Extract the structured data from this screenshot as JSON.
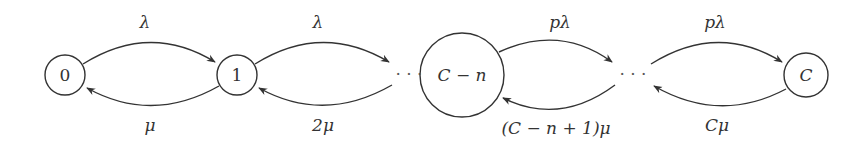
{
  "diagram": {
    "type": "birth-death Markov chain",
    "nodes": [
      {
        "id": "n0",
        "label": "0"
      },
      {
        "id": "n1",
        "label": "1"
      },
      {
        "id": "ncn",
        "label": "C − n"
      },
      {
        "id": "nc",
        "label": "C"
      }
    ],
    "ellipses": [
      "· · ·",
      "· · ·"
    ],
    "edges": [
      {
        "from": "0",
        "to": "1",
        "label": "λ"
      },
      {
        "from": "1",
        "to": "0",
        "label": "μ"
      },
      {
        "from": "1",
        "to": "…",
        "label": "λ"
      },
      {
        "from": "…",
        "to": "1",
        "label": "2μ"
      },
      {
        "from": "C − n",
        "to": "…",
        "label": "pλ"
      },
      {
        "from": "…",
        "to": "C − n",
        "label": "(C − n + 1)μ"
      },
      {
        "from": "…",
        "to": "C",
        "label": "pλ"
      },
      {
        "from": "C",
        "to": "…",
        "label": "Cμ"
      }
    ],
    "colors": {
      "stroke": "#333333",
      "background": "#ffffff"
    }
  }
}
